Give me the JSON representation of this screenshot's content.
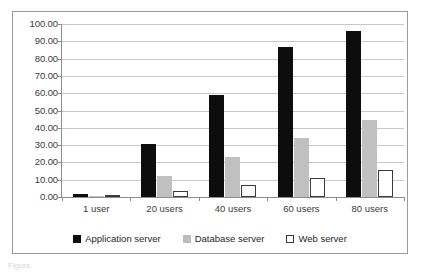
{
  "chart_data": {
    "type": "bar",
    "title": "",
    "subtitle": "",
    "xlabel": "",
    "ylabel": "",
    "categories": [
      "1 user",
      "20 users",
      "40 users",
      "60 users",
      "80 users"
    ],
    "series": [
      {
        "name": "Application server",
        "color": "#0d0d0d",
        "values": [
          1.5,
          30.5,
          59.0,
          87.0,
          96.0
        ]
      },
      {
        "name": "Database server",
        "color": "#c0c0c0",
        "values": [
          0.4,
          12.0,
          23.0,
          34.0,
          44.5
        ]
      },
      {
        "name": "Web server",
        "color": "#ffffff",
        "values": [
          0.2,
          3.5,
          7.0,
          11.0,
          15.5
        ]
      }
    ],
    "ylim": [
      0,
      100
    ],
    "ytick_interval": 10,
    "ytick_labels": [
      "0.00",
      "10.00",
      "20.00",
      "30.00",
      "40.00",
      "50.00",
      "60.00",
      "70.00",
      "80.00",
      "90.00",
      "100.00"
    ],
    "grid": true,
    "legend_position": "bottom"
  },
  "legend": {
    "items": [
      {
        "label": "Application server",
        "swatch": "legend-swatch-black"
      },
      {
        "label": "Database server",
        "swatch": "legend-swatch-gray"
      },
      {
        "label": "Web server",
        "swatch": "legend-swatch-white"
      }
    ]
  },
  "caption": {
    "text": "Figure"
  }
}
